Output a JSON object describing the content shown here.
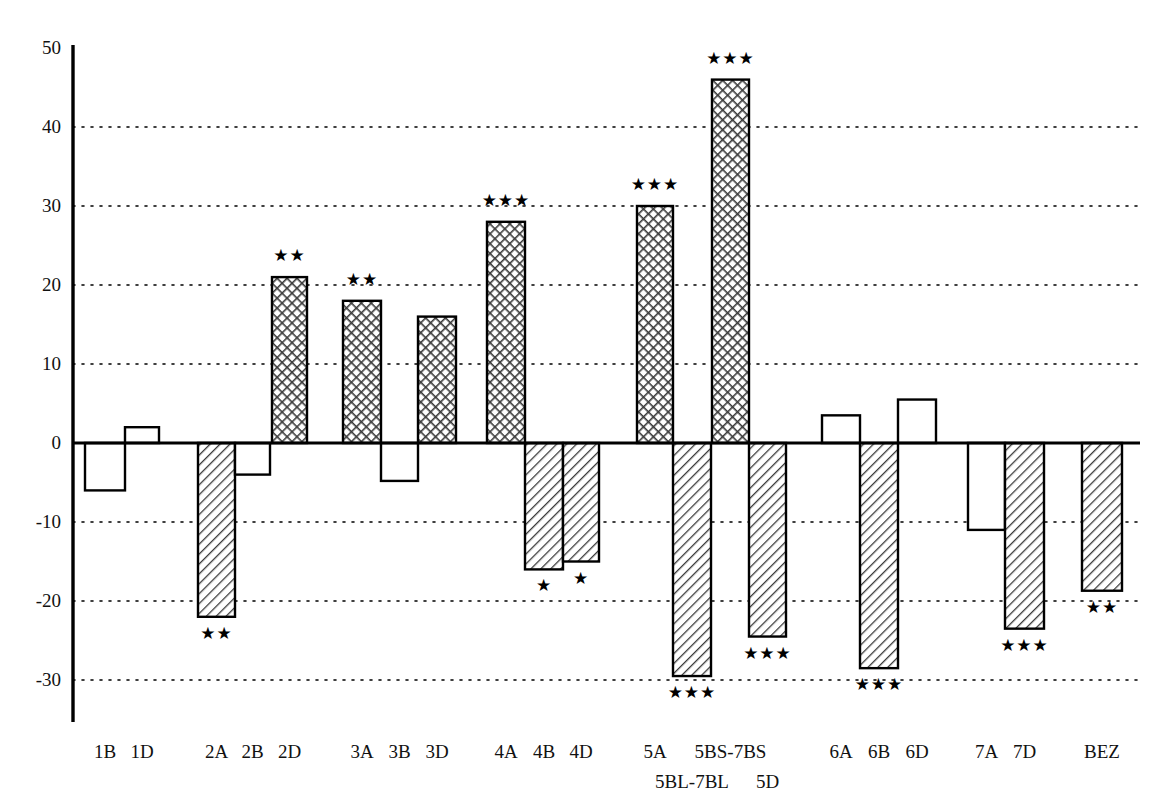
{
  "chart_data": {
    "type": "bar",
    "title": "",
    "xlabel": "",
    "ylabel": "",
    "ylim": [
      -32,
      50
    ],
    "yticks": [
      50,
      40,
      30,
      20,
      10,
      0,
      -10,
      -20,
      -30
    ],
    "ytick_labels": [
      "50",
      "40",
      "30",
      "20",
      "10",
      "0",
      "-10",
      "-20",
      "-30"
    ],
    "grid": "dotted horizontal gridlines at every 10 units except 0 and 50",
    "legend": "none",
    "zero_line": 0,
    "categories": [
      "1B",
      "1D",
      "2A",
      "2B",
      "2D",
      "3A",
      "3B",
      "3D",
      "4A",
      "4B",
      "4D",
      "5A",
      "5BL-7BL",
      "5BS-7BS",
      "5D",
      "6A",
      "6B",
      "6D",
      "7A",
      "7D",
      "BEZ"
    ],
    "values": [
      -6,
      2,
      -22,
      -4,
      21,
      18,
      -4.8,
      16,
      28,
      -16,
      -15,
      30,
      -29.5,
      46,
      -24.5,
      3.5,
      -28.5,
      5.5,
      -11,
      -23.5,
      -18.7
    ],
    "significance": [
      "",
      "",
      "**",
      "",
      "**",
      "**",
      "",
      "",
      "***",
      "*",
      "*",
      "***",
      "***",
      "***",
      "***",
      "",
      "***",
      "",
      "",
      "***",
      "**"
    ],
    "fill_patterns": [
      "none",
      "none",
      "diagonal",
      "none",
      "crosshatch",
      "crosshatch",
      "none",
      "crosshatch",
      "crosshatch",
      "diagonal",
      "diagonal",
      "crosshatch",
      "diagonal",
      "crosshatch",
      "diagonal",
      "none",
      "diagonal",
      "none",
      "none",
      "diagonal",
      "diagonal"
    ],
    "x_tick_rows": [
      {
        "label": "1B",
        "row": 0
      },
      {
        "label": "1D",
        "row": 0
      },
      {
        "label": "2A",
        "row": 0
      },
      {
        "label": "2B",
        "row": 0
      },
      {
        "label": "2D",
        "row": 0
      },
      {
        "label": "3A",
        "row": 0
      },
      {
        "label": "3B",
        "row": 0
      },
      {
        "label": "3D",
        "row": 0
      },
      {
        "label": "4A",
        "row": 0
      },
      {
        "label": "4B",
        "row": 0
      },
      {
        "label": "4D",
        "row": 0
      },
      {
        "label": "5A",
        "row": 0
      },
      {
        "label": "5BL-7BL",
        "row": 1
      },
      {
        "label": "5BS-7BS",
        "row": 0
      },
      {
        "label": "5D",
        "row": 1
      },
      {
        "label": "6A",
        "row": 0
      },
      {
        "label": "6B",
        "row": 0
      },
      {
        "label": "6D",
        "row": 0
      },
      {
        "label": "7A",
        "row": 0
      },
      {
        "label": "7D",
        "row": 0
      },
      {
        "label": "BEZ",
        "row": 0
      }
    ],
    "colors": {
      "axis": "#000000",
      "bar_outline": "#000000",
      "bar_fill": "#ffffff",
      "hatch": "#333333",
      "gridline": "#000000",
      "text": "#111111"
    }
  },
  "geometry": {
    "axis_x": 73,
    "zero_y": 443,
    "px_per_unit": 7.9,
    "top_y": 45,
    "axis_bottom_y": 722,
    "plot_right_x": 1140,
    "bars": [
      {
        "x": 85,
        "w": 40
      },
      {
        "x": 125,
        "w": 34
      },
      {
        "x": 198,
        "w": 37
      },
      {
        "x": 235,
        "w": 35
      },
      {
        "x": 272,
        "w": 35
      },
      {
        "x": 343,
        "w": 38
      },
      {
        "x": 381,
        "w": 37
      },
      {
        "x": 418,
        "w": 38
      },
      {
        "x": 487,
        "w": 38
      },
      {
        "x": 525,
        "w": 38
      },
      {
        "x": 563,
        "w": 36
      },
      {
        "x": 637,
        "w": 36
      },
      {
        "x": 673,
        "w": 38
      },
      {
        "x": 712,
        "w": 37
      },
      {
        "x": 749,
        "w": 37
      },
      {
        "x": 822,
        "w": 38
      },
      {
        "x": 860,
        "w": 38
      },
      {
        "x": 898,
        "w": 38
      },
      {
        "x": 968,
        "w": 37
      },
      {
        "x": 1005,
        "w": 39
      },
      {
        "x": 1082,
        "w": 40
      }
    ]
  }
}
